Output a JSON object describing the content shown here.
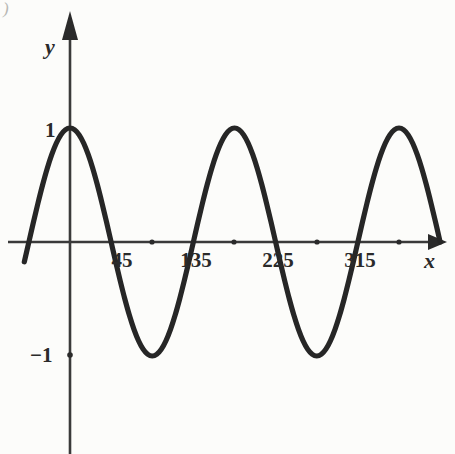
{
  "figure": {
    "corner_mark": ")",
    "axis_labels": {
      "x": "x",
      "y": "y"
    },
    "y_tick_labels": [
      {
        "text": "1",
        "value": 1
      },
      {
        "text": "−1",
        "value": -1
      }
    ],
    "x_tick_labels": [
      {
        "text": "45",
        "value": 45
      },
      {
        "text": "135",
        "value": 135
      },
      {
        "text": "225",
        "value": 225
      },
      {
        "text": "315",
        "value": 315
      }
    ],
    "colors": {
      "ink": "#2a2a2a",
      "curve": "#262626",
      "axis": "#3a3a3a",
      "background": "#fcfcfa"
    }
  },
  "chart_data": {
    "type": "line",
    "title": "",
    "subtitle": "",
    "xlabel": "x",
    "ylabel": "y",
    "function": "y = cos(2x)",
    "amplitude": 1,
    "period_degrees": 180,
    "xlim": [
      -45,
      415
    ],
    "ylim": [
      -1.45,
      1.45
    ],
    "grid": false,
    "legend": "none",
    "x_axis": {
      "unit": "degrees",
      "tick_values": [
        90,
        180,
        270,
        360
      ],
      "labeled_ticks": [
        {
          "value": 45,
          "label": "45"
        },
        {
          "value": 135,
          "label": "135"
        },
        {
          "value": 225,
          "label": "225"
        },
        {
          "value": 315,
          "label": "315"
        }
      ],
      "arrow": true
    },
    "y_axis": {
      "tick_values": [
        1,
        -1
      ],
      "labeled_ticks": [
        {
          "value": 1,
          "label": "1"
        },
        {
          "value": -1,
          "label": "−1"
        }
      ],
      "arrow": true
    },
    "key_points": {
      "maxima": [
        {
          "x": 0,
          "y": 1
        },
        {
          "x": 180,
          "y": 1
        },
        {
          "x": 360,
          "y": 1
        }
      ],
      "minima": [
        {
          "x": 90,
          "y": -1
        },
        {
          "x": 270,
          "y": -1
        }
      ],
      "zeros": [
        45,
        135,
        225,
        315
      ]
    },
    "series": [
      {
        "name": "y = cos(2x)",
        "color": "#262626",
        "x": [
          -50,
          -45,
          -40,
          -35,
          -30,
          -25,
          -20,
          -15,
          -10,
          -5,
          0,
          5,
          10,
          15,
          20,
          25,
          30,
          35,
          40,
          45,
          50,
          55,
          60,
          65,
          70,
          75,
          80,
          85,
          90,
          95,
          100,
          105,
          110,
          115,
          120,
          125,
          130,
          135,
          140,
          145,
          150,
          155,
          160,
          165,
          170,
          175,
          180,
          185,
          190,
          195,
          200,
          205,
          210,
          215,
          220,
          225,
          230,
          235,
          240,
          245,
          250,
          255,
          260,
          265,
          270,
          275,
          280,
          285,
          290,
          295,
          300,
          305,
          310,
          315,
          320,
          325,
          330,
          335,
          340,
          345,
          350,
          355,
          360,
          365,
          370,
          375,
          380,
          385,
          390,
          395,
          400,
          405
        ],
        "y": [
          -0.174,
          0.0,
          0.174,
          0.342,
          0.5,
          0.643,
          0.766,
          0.866,
          0.94,
          0.985,
          1.0,
          0.985,
          0.94,
          0.866,
          0.766,
          0.643,
          0.5,
          0.342,
          0.174,
          0.0,
          -0.174,
          -0.342,
          -0.5,
          -0.643,
          -0.766,
          -0.866,
          -0.94,
          -0.985,
          -1.0,
          -0.985,
          -0.94,
          -0.866,
          -0.766,
          -0.643,
          -0.5,
          -0.342,
          -0.174,
          0.0,
          0.174,
          0.342,
          0.5,
          0.643,
          0.766,
          0.866,
          0.94,
          0.985,
          1.0,
          0.985,
          0.94,
          0.866,
          0.766,
          0.643,
          0.5,
          0.342,
          0.174,
          0.0,
          -0.174,
          -0.342,
          -0.5,
          -0.643,
          -0.766,
          -0.866,
          -0.94,
          -0.985,
          -1.0,
          -0.985,
          -0.94,
          -0.866,
          -0.766,
          -0.643,
          -0.5,
          -0.342,
          -0.174,
          0.0,
          0.174,
          0.342,
          0.5,
          0.643,
          0.766,
          0.866,
          0.94,
          0.985,
          1.0,
          0.985,
          0.94,
          0.866,
          0.766,
          0.643,
          0.5,
          0.342,
          0.174,
          0.0
        ]
      }
    ]
  }
}
